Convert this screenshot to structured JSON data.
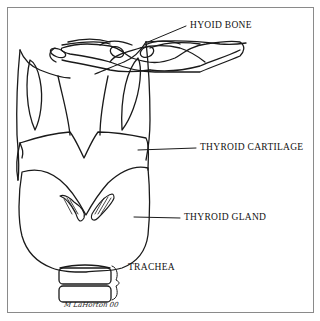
{
  "diagram": {
    "labels": {
      "hyoid_bone": "HYOID BONE",
      "thyroid_cartilage": "THYROID CARTILAGE",
      "thyroid_gland": "THYROID GLAND",
      "trachea": "TRACHEA"
    },
    "signature": "M LaHorton 00",
    "colors": {
      "line": "#1a1a1a",
      "frame": "#8a8a8a",
      "background": "#ffffff"
    }
  }
}
